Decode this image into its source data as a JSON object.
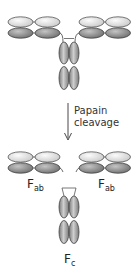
{
  "diagram": {
    "type": "antibody papain cleavage",
    "colors": {
      "light_chain_fill": "#e4e4e4",
      "heavy_chain_fill": "#9a9a9a",
      "outline": "#555555",
      "arrow": "#333333"
    },
    "arrow_label": {
      "line1": "Papain",
      "line2": "cleavage"
    },
    "fragments": {
      "fab_left": {
        "main": "F",
        "sub": "ab"
      },
      "fab_right": {
        "main": "F",
        "sub": "ab"
      },
      "fc": {
        "main": "F",
        "sub": "c"
      }
    }
  }
}
